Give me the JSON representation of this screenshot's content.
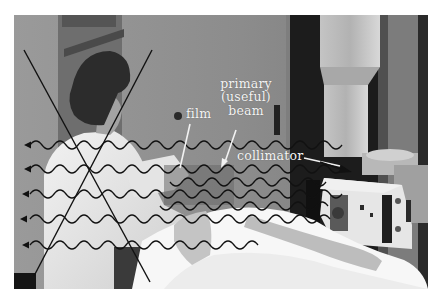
{
  "figure": {
    "labels": {
      "film": "film",
      "primary_beam_line1": "primary",
      "primary_beam_line2": "(useful)",
      "primary_beam_line3": "beam",
      "collimator": "collimator"
    },
    "annotations": {
      "cross_mark": "X over radiographer",
      "scatter_waves_count": 5,
      "scatter_direction": "leftward arrows"
    },
    "colors": {
      "label_text": "#f4f4f4",
      "annotation_line_dark": "#111111",
      "annotation_line_light": "#f2f2f2",
      "wall": "#8f8f8f",
      "dark_column": "#1c1c1c"
    }
  }
}
